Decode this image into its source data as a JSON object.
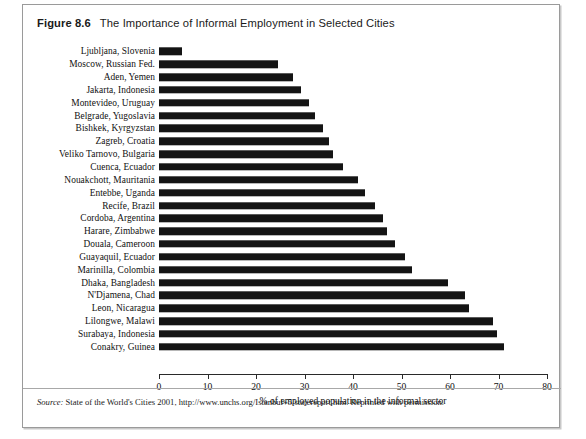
{
  "figure": {
    "number_label": "Figure 8.6",
    "title": "The Importance of Informal Employment in Selected Cities",
    "source_word": "Source:",
    "source_text": " State of the World's Cities 2001, http://www.unchs.org/Istanbul+5/statereport.htm. Reprinted with permission."
  },
  "chart_data": {
    "type": "bar",
    "orientation": "horizontal",
    "title": "The Importance of Informal Employment in Selected Cities",
    "xlabel": "% of employed population in the informal sector",
    "ylabel": "",
    "xlim": [
      0,
      80
    ],
    "xticks": [
      0,
      10,
      20,
      30,
      40,
      50,
      60,
      70,
      80
    ],
    "xtick_labels": [
      "0",
      "10",
      "20",
      "30",
      "40",
      "50",
      "60",
      "70",
      "80"
    ],
    "grid": false,
    "legend": false,
    "bar_color": "#141414",
    "categories": [
      "Ljubljana, Slovenia",
      "Moscow, Russian Fed.",
      "Aden, Yemen",
      "Jakarta, Indonesia",
      "Montevideo, Uruguay",
      "Belgrade, Yugoslavia",
      "Bishkek, Kyrgyzstan",
      "Zagreb, Croatia",
      "Veliko Tarnovo, Bulgaria",
      "Cuenca, Ecuador",
      "Nouakchott, Mauritania",
      "Entebbe, Uganda",
      "Recife, Brazil",
      "Cordoba, Argentina",
      "Harare, Zimbabwe",
      "Douala, Cameroon",
      "Guayaquil, Ecuador",
      "Marinilla, Colombia",
      "Dhaka, Bangladesh",
      "N'Djamena, Chad",
      "Leon, Nicaragua",
      "Lilongwe, Malawi",
      "Surabaya, Indonesia",
      "Conakry, Guinea"
    ],
    "values": [
      4.7,
      24.5,
      27.6,
      29.3,
      30.9,
      32.2,
      33.8,
      35.1,
      35.9,
      37.9,
      41.0,
      42.5,
      44.5,
      46.2,
      47.0,
      48.7,
      50.7,
      52.2,
      59.6,
      63.1,
      64.0,
      68.9,
      69.7,
      71.1
    ]
  }
}
